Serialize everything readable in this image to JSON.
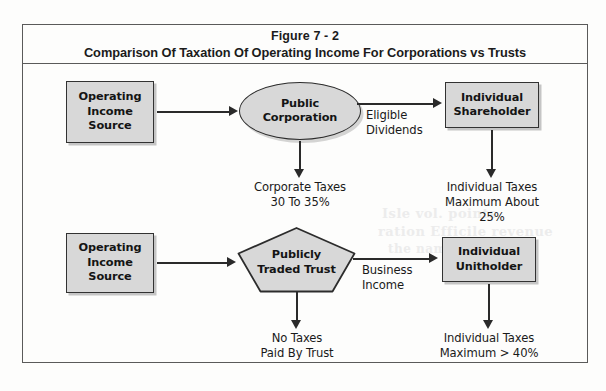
{
  "figure": {
    "title_line1": "Figure 7 - 2",
    "title_line2": "Comparison Of Taxation Of Operating Income For Corporations vs Trusts"
  },
  "diagram": {
    "corporate_row": {
      "source_node": "Operating\nIncome\nSource",
      "entity_node": "Public\nCorporation",
      "recipient_node": "Individual\nShareholder",
      "flow_label": "Eligible\nDividends",
      "entity_tax_caption": "Corporate Taxes\n30 To 35%",
      "recipient_tax_caption": "Individual Taxes\nMaximum About 25%"
    },
    "trust_row": {
      "source_node": "Operating\nIncome\nSource",
      "entity_node": "Publicly\nTraded Trust",
      "recipient_node": "Individual\nUnitholder",
      "flow_label": "Business\nIncome",
      "entity_tax_caption": "No Taxes\nPaid By Trust",
      "recipient_tax_caption": "Individual Taxes\nMaximum > 40%"
    }
  },
  "colors": {
    "node_fill": "#d8d8d8",
    "node_border": "#323232",
    "frame_border": "#5a5a5a",
    "connector": "#2a2a2a",
    "page_background": "#fdfdfc",
    "text": "#141414"
  },
  "artifacts": {
    "ghost_text_1": "Isle vol. points",
    "ghost_text_2": "ration Efficile revenue",
    "ghost_text_3": "the name, the prize"
  }
}
